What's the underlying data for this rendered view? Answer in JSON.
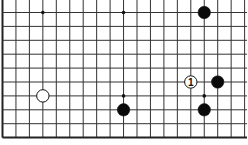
{
  "diagram": {
    "type": "go-board-fragment",
    "grid": {
      "columns": 19,
      "rows": 10,
      "origin_x": 2.5,
      "origin_y": 12.5,
      "spacing_x": 13.45,
      "spacing_y": 13.9,
      "left_edge": true,
      "bottom_edge": true,
      "top_edge": false,
      "right_edge": false,
      "line_color": "#333333",
      "edge_color": "#222222"
    },
    "star_points": [
      {
        "col": 3,
        "row": 0
      },
      {
        "col": 9,
        "row": 0
      },
      {
        "col": 9,
        "row": 6
      },
      {
        "col": 15,
        "row": 6
      }
    ],
    "stones": [
      {
        "color": "black",
        "col": 15,
        "row": 0,
        "label": ""
      },
      {
        "color": "black",
        "col": 16,
        "row": 5,
        "label": ""
      },
      {
        "color": "white",
        "col": 14,
        "row": 5,
        "label": "1"
      },
      {
        "color": "black",
        "col": 15,
        "row": 7,
        "label": ""
      },
      {
        "color": "black",
        "col": 9,
        "row": 7,
        "label": ""
      },
      {
        "color": "white",
        "col": 3,
        "row": 6,
        "label": ""
      }
    ]
  }
}
